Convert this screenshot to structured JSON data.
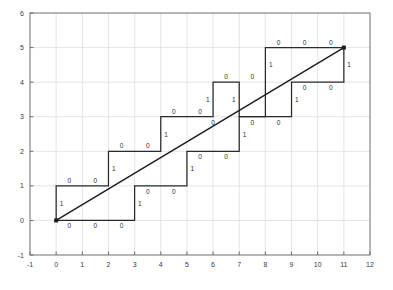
{
  "chart_data": {
    "type": "line",
    "title": "",
    "xlabel": "",
    "ylabel": "",
    "xlim": [
      -1,
      12
    ],
    "ylim": [
      -1,
      6
    ],
    "xticks": [
      -1,
      0,
      1,
      2,
      3,
      4,
      5,
      6,
      7,
      8,
      9,
      10,
      11,
      12
    ],
    "xtick_labels": [
      "-1",
      "0",
      "1",
      "2",
      "3",
      "4",
      "5",
      "6",
      "7",
      "8",
      "9",
      "10",
      "11",
      "12"
    ],
    "yticks": [
      -1,
      0,
      1,
      2,
      3,
      4,
      5,
      6
    ],
    "ytick_labels": [
      "-1",
      "0",
      "1",
      "2",
      "3",
      "4",
      "5",
      "6"
    ],
    "grid": true,
    "legend": null,
    "colors": {
      "axis": "#6e6e6e",
      "grid": "#d8d8d8",
      "line": "#1a1a1a",
      "path": "#2a2a2a",
      "label": "#2e2e2e",
      "background": "#ffffff"
    },
    "series": [
      {
        "name": "diagonal-line",
        "type": "line",
        "points": [
          [
            0,
            0
          ],
          [
            11,
            5
          ]
        ],
        "markers": [
          [
            0,
            0
          ],
          [
            11,
            5
          ]
        ]
      },
      {
        "name": "upper-staircase",
        "type": "step-path",
        "points": [
          [
            0,
            0
          ],
          [
            0,
            1
          ],
          [
            2,
            1
          ],
          [
            2,
            2
          ],
          [
            4,
            2
          ],
          [
            4,
            3
          ],
          [
            6,
            3
          ],
          [
            6,
            4
          ],
          [
            7,
            4
          ],
          [
            7,
            3
          ],
          [
            9,
            3
          ],
          [
            9,
            4
          ],
          [
            11,
            4
          ],
          [
            11,
            5
          ]
        ]
      },
      {
        "name": "lower-staircase",
        "type": "step-path",
        "points": [
          [
            0,
            0
          ],
          [
            3,
            0
          ],
          [
            3,
            1
          ],
          [
            5,
            1
          ],
          [
            5,
            2
          ],
          [
            7,
            2
          ],
          [
            7,
            3
          ],
          [
            8,
            3
          ],
          [
            8,
            5
          ],
          [
            11,
            5
          ]
        ]
      }
    ],
    "step_labels": [
      {
        "text": "1",
        "x": 0.0,
        "y": 0.5,
        "anchor": "right",
        "series": "upper"
      },
      {
        "text": "0",
        "x": 0.5,
        "y": 1.0,
        "anchor": "above",
        "series": "upper"
      },
      {
        "text": "0",
        "x": 1.5,
        "y": 1.0,
        "anchor": "above",
        "series": "upper"
      },
      {
        "text": "1",
        "x": 2.0,
        "y": 1.5,
        "anchor": "right",
        "series": "upper"
      },
      {
        "text": "0",
        "x": 2.5,
        "y": 2.0,
        "anchor": "above",
        "series": "upper"
      },
      {
        "text": "0",
        "x": 3.5,
        "y": 2.0,
        "anchor": "above",
        "series": "upper"
      },
      {
        "text": "1",
        "x": 4.0,
        "y": 2.5,
        "anchor": "right",
        "series": "upper"
      },
      {
        "text": "0",
        "x": 4.5,
        "y": 3.0,
        "anchor": "above",
        "series": "upper"
      },
      {
        "text": "0",
        "x": 5.5,
        "y": 3.0,
        "anchor": "above",
        "series": "upper"
      },
      {
        "text": "1",
        "x": 6.0,
        "y": 3.5,
        "anchor": "left",
        "series": "upper"
      },
      {
        "text": "0",
        "x": 6.5,
        "y": 4.0,
        "anchor": "above",
        "series": "upper"
      },
      {
        "text": "1",
        "x": 7.0,
        "y": 3.5,
        "anchor": "left",
        "series": "upper"
      },
      {
        "text": "0",
        "x": 6.0,
        "y": 3.0,
        "anchor": "below",
        "series": "upper"
      },
      {
        "text": "0",
        "x": 7.5,
        "y": 4.0,
        "anchor": "above",
        "series": "upper"
      },
      {
        "text": "0",
        "x": 7.5,
        "y": 3.0,
        "anchor": "below",
        "series": "upper"
      },
      {
        "text": "0",
        "x": 8.5,
        "y": 3.0,
        "anchor": "below",
        "series": "upper"
      },
      {
        "text": "1",
        "x": 9.0,
        "y": 3.5,
        "anchor": "right",
        "series": "upper"
      },
      {
        "text": "0",
        "x": 9.5,
        "y": 4.0,
        "anchor": "below",
        "series": "upper"
      },
      {
        "text": "0",
        "x": 10.5,
        "y": 4.0,
        "anchor": "below",
        "series": "upper"
      },
      {
        "text": "1",
        "x": 11.0,
        "y": 4.5,
        "anchor": "right",
        "series": "upper"
      },
      {
        "text": "0",
        "x": 0.5,
        "y": 0.0,
        "anchor": "below",
        "series": "lower"
      },
      {
        "text": "0",
        "x": 1.5,
        "y": 0.0,
        "anchor": "below",
        "series": "lower"
      },
      {
        "text": "0",
        "x": 2.5,
        "y": 0.0,
        "anchor": "below",
        "series": "lower"
      },
      {
        "text": "1",
        "x": 3.0,
        "y": 0.5,
        "anchor": "right",
        "series": "lower"
      },
      {
        "text": "0",
        "x": 3.5,
        "y": 1.0,
        "anchor": "below",
        "series": "lower"
      },
      {
        "text": "0",
        "x": 4.5,
        "y": 1.0,
        "anchor": "below",
        "series": "lower"
      },
      {
        "text": "1",
        "x": 5.0,
        "y": 1.5,
        "anchor": "right",
        "series": "lower"
      },
      {
        "text": "0",
        "x": 5.5,
        "y": 2.0,
        "anchor": "below",
        "series": "lower"
      },
      {
        "text": "0",
        "x": 6.5,
        "y": 2.0,
        "anchor": "below",
        "series": "lower"
      },
      {
        "text": "1",
        "x": 7.0,
        "y": 2.5,
        "anchor": "right",
        "series": "lower"
      },
      {
        "text": "1",
        "x": 8.0,
        "y": 4.5,
        "anchor": "right",
        "series": "lower"
      },
      {
        "text": "0",
        "x": 8.5,
        "y": 5.0,
        "anchor": "above",
        "series": "lower"
      },
      {
        "text": "0",
        "x": 9.5,
        "y": 5.0,
        "anchor": "above",
        "series": "lower"
      },
      {
        "text": "0",
        "x": 10.5,
        "y": 5.0,
        "anchor": "above",
        "series": "lower"
      }
    ]
  }
}
